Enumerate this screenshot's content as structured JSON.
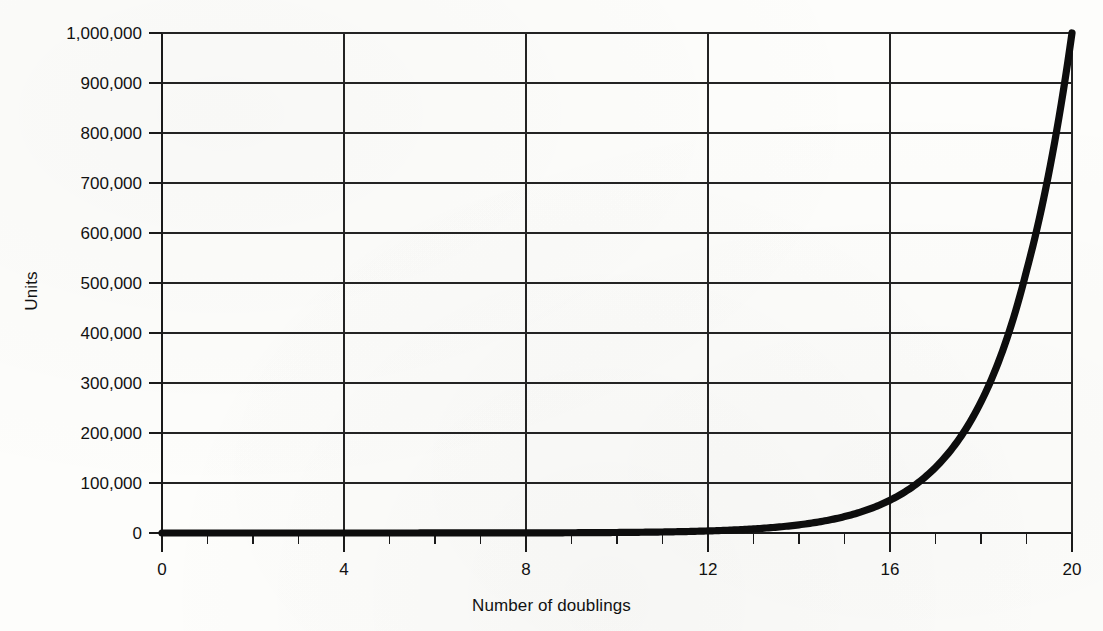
{
  "chart_data": {
    "type": "line",
    "title": "",
    "xlabel": "Number of doublings",
    "ylabel": "Units",
    "xlim": [
      0,
      20
    ],
    "ylim": [
      0,
      1000000
    ],
    "grid": true,
    "legend": "none",
    "x_tick_labels": [
      "0",
      "4",
      "8",
      "12",
      "16",
      "20"
    ],
    "x_tick_values": [
      0,
      4,
      8,
      12,
      16,
      20
    ],
    "x_minor_tick_interval": 1,
    "y_tick_labels": [
      "0",
      "100,000",
      "200,000",
      "300,000",
      "400,000",
      "500,000",
      "600,000",
      "700,000",
      "800,000",
      "900,000",
      "1,000,000"
    ],
    "y_tick_values": [
      0,
      100000,
      200000,
      300000,
      400000,
      500000,
      600000,
      700000,
      800000,
      900000,
      1000000
    ],
    "series": [
      {
        "name": "Units after n doublings",
        "x": [
          0,
          1,
          2,
          3,
          4,
          5,
          6,
          7,
          8,
          9,
          10,
          11,
          12,
          13,
          14,
          15,
          16,
          17,
          18,
          19,
          20
        ],
        "values": [
          1,
          2,
          4,
          8,
          16,
          32,
          64,
          128,
          256,
          512,
          1024,
          2048,
          4096,
          8192,
          16384,
          32768,
          65536,
          131072,
          262144,
          524288,
          1000000
        ]
      }
    ],
    "curve_color": "#0d0d0d",
    "gridline_color": "#232323",
    "axis_color": "#1a1a1a",
    "background_color": "#fdfdfb"
  }
}
